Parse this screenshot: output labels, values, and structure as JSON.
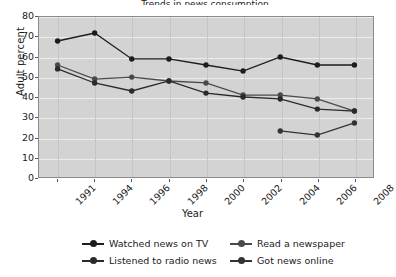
{
  "chart_data": {
    "type": "line",
    "title": "Trends in news consumption",
    "xlabel": "Year",
    "ylabel": "Adult percent",
    "x": [
      1991,
      1994,
      1996,
      1998,
      2000,
      2002,
      2004,
      2006,
      2008
    ],
    "xticklabels": [
      "1991",
      "1994",
      "1996",
      "1998",
      "2000",
      "2002",
      "2004",
      "2006",
      "2008"
    ],
    "ylim": [
      0,
      80
    ],
    "yticks": [
      0,
      10,
      20,
      30,
      40,
      50,
      60,
      70,
      80
    ],
    "yticklabels": [
      "0",
      "10",
      "20",
      "30",
      "40",
      "50",
      "60",
      "70",
      "80"
    ],
    "grid": "horizontal-white-on-gray",
    "legend_position": "bottom",
    "series": [
      {
        "name": "Watched news on TV",
        "color": "#1c1c1c",
        "marker": "circle",
        "x": [
          1991,
          1994,
          1996,
          1998,
          2000,
          2002,
          2004,
          2006,
          2008
        ],
        "values": [
          68,
          72,
          59,
          59,
          56,
          53,
          60,
          56,
          56
        ]
      },
      {
        "name": "Read a newspaper",
        "color": "#4a4a4a",
        "marker": "circle",
        "x": [
          1991,
          1994,
          1996,
          1998,
          2000,
          2002,
          2004,
          2006,
          2008
        ],
        "values": [
          56,
          49,
          50,
          48,
          47,
          41,
          41,
          39,
          33
        ]
      },
      {
        "name": "Listened to radio news",
        "color": "#2a2a2a",
        "marker": "circle",
        "x": [
          1991,
          1994,
          1996,
          1998,
          2000,
          2002,
          2004,
          2006,
          2008
        ],
        "values": [
          54,
          47,
          43,
          48,
          42,
          40,
          39,
          34,
          33
        ]
      },
      {
        "name": "Got news online",
        "color": "#333333",
        "marker": "circle",
        "x": [
          2004,
          2006,
          2008
        ],
        "values": [
          23,
          21,
          27
        ]
      }
    ]
  },
  "legend": {
    "items": [
      {
        "label": "Watched news on TV"
      },
      {
        "label": "Read a newspaper"
      },
      {
        "label": "Listened to radio news"
      },
      {
        "label": "Got news online"
      }
    ]
  },
  "colors": {
    "plot_background": "#d3d3d3",
    "gridline": "#ededed",
    "axis": "#8a8a8a",
    "text": "#1a1a1a",
    "page_background": "#ffffff"
  }
}
